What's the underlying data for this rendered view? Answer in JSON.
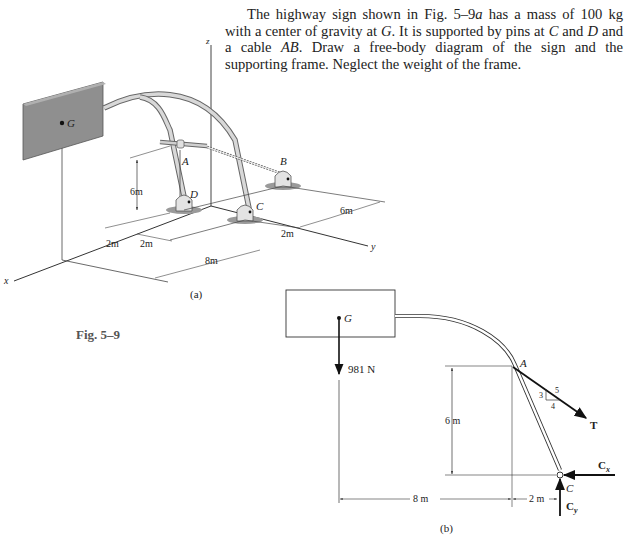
{
  "problem": {
    "text_parts": [
      "The highway sign shown in Fig. 5–9",
      "a",
      " has a mass of 100 kg with a center of gravity at ",
      "G",
      ". It is supported by pins at ",
      "C",
      " and ",
      "D",
      " and a cable ",
      "AB",
      ". Draw a free-body diagram of the sign and the supporting frame. Neglect the weight of the frame."
    ]
  },
  "figure_label": "Fig. 5–9",
  "figure_a": {
    "caption": "(a)",
    "axes": {
      "x": "x",
      "y": "y",
      "z": "z"
    },
    "points": {
      "G": "G",
      "A": "A",
      "B": "B",
      "C": "C",
      "D": "D"
    },
    "dimensions": {
      "height": "6m",
      "d1": "2m",
      "d2": "2m",
      "d3": "8m",
      "d4": "2m",
      "d5": "6m"
    }
  },
  "figure_b": {
    "caption": "(b)",
    "points": {
      "G": "G",
      "A": "A",
      "C": "C"
    },
    "forces": {
      "weight": "981 N",
      "tension": "T",
      "cx": "C",
      "cx_sub": "x",
      "cy": "C",
      "cy_sub": "y"
    },
    "slope": {
      "rise": "3",
      "run": "4",
      "hyp": "5"
    },
    "dimensions": {
      "height": "6 m",
      "horizontal1": "8 m",
      "horizontal2": "2 m"
    }
  }
}
